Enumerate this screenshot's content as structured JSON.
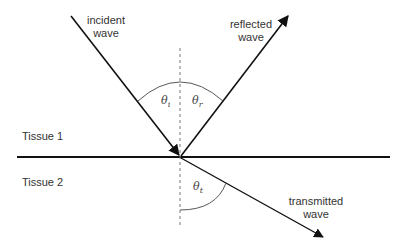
{
  "labels": {
    "incident_line1": "incident",
    "incident_line2": "wave",
    "reflected_line1": "reflected",
    "reflected_line2": "wave",
    "transmitted_line1": "transmitted",
    "transmitted_line2": "wave",
    "tissue1": "Tissue 1",
    "tissue2": "Tissue 2"
  },
  "angles": {
    "incident": {
      "symbol": "θ",
      "subscript": "i"
    },
    "reflected": {
      "symbol": "θ",
      "subscript": "r"
    },
    "transmitted": {
      "symbol": "θ",
      "subscript": "t"
    }
  },
  "colors": {
    "line": "#111111",
    "normal": "#666666",
    "arc": "#444444",
    "text": "#333333"
  }
}
